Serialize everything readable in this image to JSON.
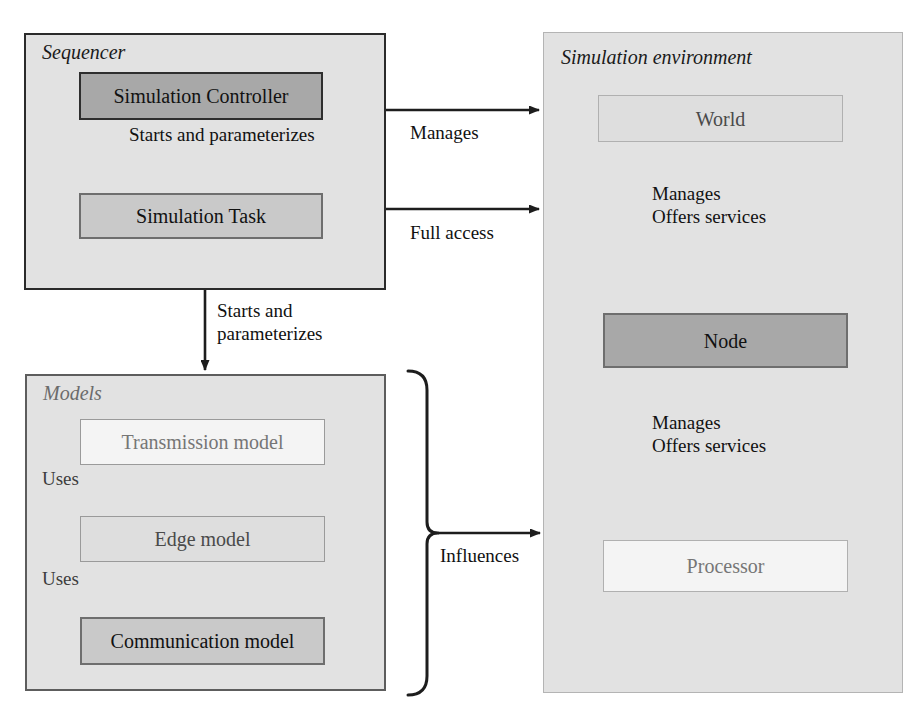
{
  "diagram": {
    "background": "#ffffff",
    "palette": {
      "container_fill": "#e2e2e2",
      "dark_fill": "#a8a8a8",
      "mid_fill": "#c9c9c9",
      "light_fill": "#dedede",
      "white_fill": "#f4f4f4",
      "stroke_strong": "#2b2b2b",
      "stroke_medium": "#5d5d5d",
      "stroke_light": "#b4b4b4"
    }
  },
  "groups": {
    "sequencer": {
      "title": "Sequencer",
      "nodes": {
        "simulation_controller": "Simulation Controller",
        "simulation_task": "Simulation Task"
      },
      "internal_edge": "Starts and parameterizes"
    },
    "models": {
      "title": "Models",
      "nodes": {
        "transmission_model": "Transmission model",
        "edge_model": "Edge model",
        "communication_model": "Communication model"
      },
      "edges": {
        "transmission_to_edge": "Uses",
        "edge_to_communication": "Uses"
      }
    },
    "simulation_environment": {
      "title": "Simulation environment",
      "nodes": {
        "world": "World",
        "node": "Node",
        "processor": "Processor"
      },
      "edges": {
        "world_to_node_line1": "Manages",
        "world_to_node_line2": "Offers services",
        "node_to_processor_line1": "Manages",
        "node_to_processor_line2": "Offers services"
      }
    }
  },
  "cross_edges": {
    "controller_to_environment": "Manages",
    "task_to_environment": "Full access",
    "sequencer_to_models_line1": "Starts and",
    "sequencer_to_models_line2": "parameterizes",
    "models_to_environment": "Influences"
  }
}
